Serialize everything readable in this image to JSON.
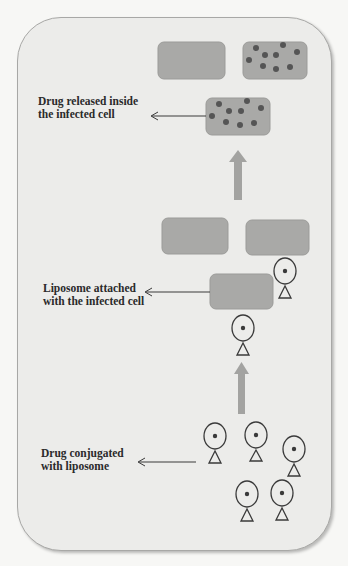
{
  "diagram": {
    "colors": {
      "cell_fill": "#a9a9a7",
      "cell_stroke": "#9b9b99",
      "drug_dot": "#555555",
      "arrow_fill": "#a3a3a1",
      "outline": "#3a3a3a",
      "card_bg": "#ececea"
    },
    "stages": [
      {
        "id": "drug-released",
        "label_line1": "Drug released inside",
        "label_line2": "the infected cell"
      },
      {
        "id": "liposome-attached",
        "label_line1": "Liposome attached",
        "label_line2": "with the infected cell"
      },
      {
        "id": "drug-conjugated",
        "label_line1": "Drug conjugated",
        "label_line2": "with liposome"
      }
    ]
  }
}
